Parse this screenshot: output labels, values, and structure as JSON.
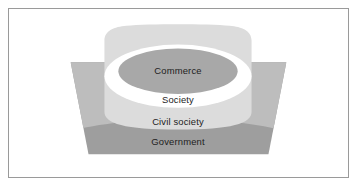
{
  "figure": {
    "type": "nested-layers-diagram",
    "frame": {
      "border_color": "#9a9a9a",
      "background_color": "#ffffff"
    },
    "layers": [
      {
        "id": "government",
        "label": "Government",
        "shape": "trapezoid",
        "color": "#9e9e9e",
        "level": 4
      },
      {
        "id": "civil-society",
        "label": "Civil society",
        "shape": "rounded-band",
        "color": "#bdbdbd",
        "level": 3
      },
      {
        "id": "society",
        "label": "Society",
        "shape": "rounded-rect",
        "color": "#dcdcdc",
        "level": 2
      },
      {
        "id": "ring",
        "label": "",
        "shape": "ellipse",
        "color": "#ffffff",
        "level": 1
      },
      {
        "id": "commerce",
        "label": "Commerce",
        "shape": "ellipse",
        "color": "#a8a8a8",
        "level": 0
      }
    ],
    "labels": {
      "commerce": "Commerce",
      "society": "Society",
      "civil_society": "Civil society",
      "government": "Government"
    }
  }
}
